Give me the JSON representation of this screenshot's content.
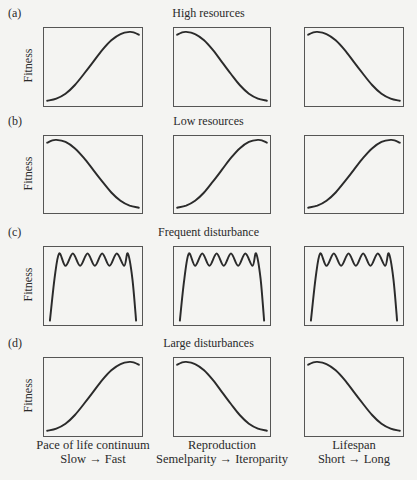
{
  "figure": {
    "rows": [
      {
        "panel": "(a)",
        "title": "High resources",
        "ylabel": "Fitness",
        "curves": [
          "increasing",
          "decreasing",
          "decreasing"
        ]
      },
      {
        "panel": "(b)",
        "title": "Low resources",
        "ylabel": "Fitness",
        "curves": [
          "decreasing",
          "increasing",
          "increasing"
        ]
      },
      {
        "panel": "(c)",
        "title": "Frequent disturbance",
        "ylabel": "Fitness",
        "curves": [
          "oscillating",
          "oscillating",
          "oscillating"
        ]
      },
      {
        "panel": "(d)",
        "title": "Large disturbances",
        "ylabel": "Fitness",
        "curves": [
          "increasing",
          "decreasing",
          "decreasing"
        ]
      }
    ],
    "columns": [
      {
        "label": "Pace of life continuum",
        "sublabel": "Slow → Fast"
      },
      {
        "label": "Reproduction",
        "sublabel": "Semelparity → Iteroparity"
      },
      {
        "label": "Lifespan",
        "sublabel": "Short → Long"
      }
    ]
  },
  "chart_data": {
    "type": "line",
    "title": "",
    "grid": false,
    "ylabel": "Fitness",
    "panels": [
      {
        "row": "(a) High resources",
        "x_axes": [
          "Pace of life continuum (Slow → Fast)",
          "Reproduction (Semelparity → Iteroparity)",
          "Lifespan (Short → Long)"
        ],
        "shapes": [
          "sigmoid increasing",
          "sigmoid decreasing",
          "sigmoid decreasing"
        ]
      },
      {
        "row": "(b) Low resources",
        "x_axes": [
          "Pace of life continuum (Slow → Fast)",
          "Reproduction (Semelparity → Iteroparity)",
          "Lifespan (Short → Long)"
        ],
        "shapes": [
          "sigmoid decreasing",
          "sigmoid increasing",
          "sigmoid increasing"
        ]
      },
      {
        "row": "(c) Frequent disturbance",
        "x_axes": [
          "Pace of life continuum (Slow → Fast)",
          "Reproduction (Semelparity → Iteroparity)",
          "Lifespan (Short → Long)"
        ],
        "shapes": [
          "plateau with 4 peaks",
          "plateau with 4 peaks",
          "plateau with 4 peaks"
        ]
      },
      {
        "row": "(d) Large disturbances",
        "x_axes": [
          "Pace of life continuum (Slow → Fast)",
          "Reproduction (Semelparity → Iteroparity)",
          "Lifespan (Short → Long)"
        ],
        "shapes": [
          "sigmoid increasing",
          "sigmoid decreasing",
          "sigmoid decreasing"
        ]
      }
    ],
    "series_points": {
      "increasing": {
        "x": [
          0,
          0.1,
          0.2,
          0.3,
          0.4,
          0.5,
          0.6,
          0.7,
          0.8,
          0.9,
          0.95,
          1.0
        ],
        "y": [
          0.02,
          0.05,
          0.12,
          0.24,
          0.4,
          0.57,
          0.74,
          0.88,
          0.97,
          1.0,
          0.99,
          0.96
        ]
      },
      "decreasing": {
        "x": [
          0,
          0.05,
          0.1,
          0.2,
          0.3,
          0.4,
          0.5,
          0.6,
          0.7,
          0.8,
          0.9,
          1.0
        ],
        "y": [
          0.96,
          0.99,
          1.0,
          0.97,
          0.88,
          0.74,
          0.57,
          0.4,
          0.24,
          0.12,
          0.05,
          0.02
        ]
      },
      "oscillating": {
        "x": [
          0.03,
          0.08,
          0.13,
          0.2,
          0.28,
          0.36,
          0.44,
          0.52,
          0.6,
          0.68,
          0.76,
          0.84,
          0.88,
          0.93,
          0.97
        ],
        "y": [
          0.02,
          0.6,
          0.95,
          0.78,
          0.95,
          0.78,
          0.95,
          0.78,
          0.95,
          0.78,
          0.95,
          0.78,
          0.95,
          0.6,
          0.02
        ]
      }
    }
  }
}
